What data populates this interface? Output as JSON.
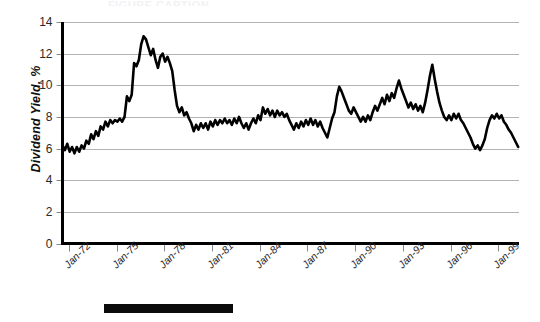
{
  "figure": {
    "top_fragment_text": "FIGURE CAPTION",
    "caption_bar_label": "solid-black-caption-bar"
  },
  "chart_data": {
    "type": "line",
    "title": "",
    "xlabel": "",
    "ylabel": "Dividend Yield, %",
    "ylim": [
      0,
      14
    ],
    "ytick_values": [
      0,
      2,
      4,
      6,
      8,
      10,
      12,
      14
    ],
    "ytick_labels": [
      "0",
      "2",
      "4",
      "6",
      "8",
      "10",
      "12",
      "14"
    ],
    "grid": true,
    "grid_color": "#b3b3b3",
    "legend": "none",
    "line_color": "#000000",
    "line_width": 2.6,
    "xtick_labels": [
      "Jan-72",
      "Jan-75",
      "Jan-78",
      "Jan-81",
      "Jan-84",
      "Jan-87",
      "Jan-90",
      "Jan-93",
      "Jan-96",
      "Jan-99"
    ],
    "xtick_x": [
      1972,
      1975,
      1978,
      1981,
      1984,
      1987,
      1990,
      1993,
      1996,
      1999
    ],
    "xlim": [
      1971.6,
      2000.3
    ],
    "series": [
      {
        "name": "Dividend Yield",
        "x": [
          1971.6,
          1971.75,
          1971.9,
          1972.05,
          1972.2,
          1972.35,
          1972.5,
          1972.65,
          1972.8,
          1972.95,
          1973.1,
          1973.25,
          1973.4,
          1973.55,
          1973.7,
          1973.85,
          1974.0,
          1974.15,
          1974.3,
          1974.45,
          1974.6,
          1974.75,
          1974.9,
          1975.05,
          1975.2,
          1975.35,
          1975.5,
          1975.65,
          1975.8,
          1975.95,
          1976.1,
          1976.25,
          1976.4,
          1976.55,
          1976.7,
          1976.85,
          1977.0,
          1977.15,
          1977.3,
          1977.45,
          1977.6,
          1977.75,
          1977.9,
          1978.05,
          1978.2,
          1978.35,
          1978.5,
          1978.65,
          1978.8,
          1978.95,
          1979.1,
          1979.25,
          1979.4,
          1979.55,
          1979.7,
          1979.85,
          1980.0,
          1980.15,
          1980.3,
          1980.45,
          1980.6,
          1980.75,
          1980.9,
          1981.05,
          1981.2,
          1981.35,
          1981.5,
          1981.65,
          1981.8,
          1981.95,
          1982.1,
          1982.25,
          1982.4,
          1982.55,
          1982.7,
          1982.85,
          1983.0,
          1983.15,
          1983.3,
          1983.45,
          1983.6,
          1983.75,
          1983.9,
          1984.05,
          1984.2,
          1984.35,
          1984.5,
          1984.65,
          1984.8,
          1984.95,
          1985.1,
          1985.25,
          1985.4,
          1985.55,
          1985.7,
          1985.85,
          1986.0,
          1986.15,
          1986.3,
          1986.45,
          1986.6,
          1986.75,
          1986.9,
          1987.05,
          1987.2,
          1987.35,
          1987.5,
          1987.65,
          1987.8,
          1987.95,
          1988.1,
          1988.25,
          1988.4,
          1988.55,
          1988.7,
          1988.85,
          1989.0,
          1989.15,
          1989.3,
          1989.45,
          1989.6,
          1989.75,
          1989.9,
          1990.05,
          1990.2,
          1990.35,
          1990.5,
          1990.65,
          1990.8,
          1990.95,
          1991.1,
          1991.25,
          1991.4,
          1991.55,
          1991.7,
          1991.85,
          1992.0,
          1992.15,
          1992.3,
          1992.45,
          1992.6,
          1992.75,
          1992.9,
          1993.05,
          1993.2,
          1993.35,
          1993.5,
          1993.65,
          1993.8,
          1993.95,
          1994.1,
          1994.25,
          1994.4,
          1994.55,
          1994.7,
          1994.85,
          1995.0,
          1995.15,
          1995.3,
          1995.45,
          1995.6,
          1995.75,
          1995.9,
          1996.05,
          1996.2,
          1996.35,
          1996.5,
          1996.65,
          1996.8,
          1996.95,
          1997.1,
          1997.25,
          1997.4,
          1997.55,
          1997.7,
          1997.85,
          1998.0,
          1998.15,
          1998.3,
          1998.45,
          1998.6,
          1998.75,
          1998.9,
          1999.05,
          1999.2,
          1999.35,
          1999.5,
          1999.65,
          1999.8,
          1999.95,
          2000.1,
          2000.25
        ],
        "values": [
          6.2,
          5.9,
          6.3,
          5.8,
          6.1,
          5.7,
          6.1,
          5.8,
          6.2,
          6.0,
          6.5,
          6.3,
          6.9,
          6.6,
          7.1,
          6.8,
          7.4,
          7.2,
          7.7,
          7.4,
          7.8,
          7.6,
          7.8,
          7.7,
          7.9,
          7.7,
          8.0,
          9.3,
          9.0,
          9.4,
          11.4,
          11.2,
          11.6,
          12.6,
          13.1,
          12.9,
          12.4,
          11.9,
          12.3,
          11.6,
          11.1,
          11.8,
          12.0,
          11.5,
          11.8,
          11.4,
          10.9,
          9.7,
          8.7,
          8.3,
          8.6,
          8.1,
          8.3,
          7.9,
          7.6,
          7.1,
          7.5,
          7.2,
          7.6,
          7.3,
          7.6,
          7.2,
          7.7,
          7.4,
          7.8,
          7.5,
          7.8,
          7.6,
          7.9,
          7.6,
          7.8,
          7.5,
          7.9,
          7.6,
          8.0,
          7.6,
          7.3,
          7.6,
          7.2,
          7.6,
          7.9,
          7.6,
          8.1,
          7.8,
          8.6,
          8.2,
          8.5,
          8.1,
          8.4,
          8.0,
          8.4,
          8.1,
          8.3,
          8.0,
          8.2,
          7.8,
          7.5,
          7.2,
          7.6,
          7.3,
          7.7,
          7.4,
          7.8,
          7.5,
          7.9,
          7.5,
          7.8,
          7.4,
          7.7,
          7.3,
          7.0,
          6.7,
          7.3,
          7.9,
          8.3,
          9.3,
          9.9,
          9.6,
          9.2,
          8.8,
          8.4,
          8.2,
          8.6,
          8.3,
          8.0,
          7.7,
          8.0,
          7.7,
          8.1,
          7.8,
          8.3,
          8.7,
          8.4,
          8.8,
          9.2,
          8.8,
          9.4,
          9.0,
          9.5,
          9.2,
          9.8,
          10.3,
          9.8,
          9.4,
          9.0,
          8.6,
          8.9,
          8.5,
          8.8,
          8.4,
          8.7,
          8.3,
          8.9,
          9.7,
          10.6,
          11.3,
          10.4,
          9.6,
          8.9,
          8.4,
          8.0,
          7.8,
          8.1,
          7.8,
          8.2,
          7.9,
          8.2,
          7.8,
          7.6,
          7.3,
          7.0,
          6.7,
          6.3,
          6.0,
          6.2,
          5.9,
          6.2,
          6.6,
          7.3,
          7.8,
          8.1,
          7.9,
          8.2,
          7.9,
          8.1,
          7.7,
          7.5,
          7.2,
          7.0,
          6.7,
          6.4,
          6.1
        ]
      }
    ],
    "notes": {
      "peak_value": 13.1,
      "peak_x_label": "Jan-75",
      "start_value": 6.2,
      "end_value": 7.0,
      "secondary_peak_value": 11.3,
      "secondary_peak_x_label": "Jan-90",
      "trough_value": 5.3,
      "trough_x_label": "Jan-97"
    }
  }
}
